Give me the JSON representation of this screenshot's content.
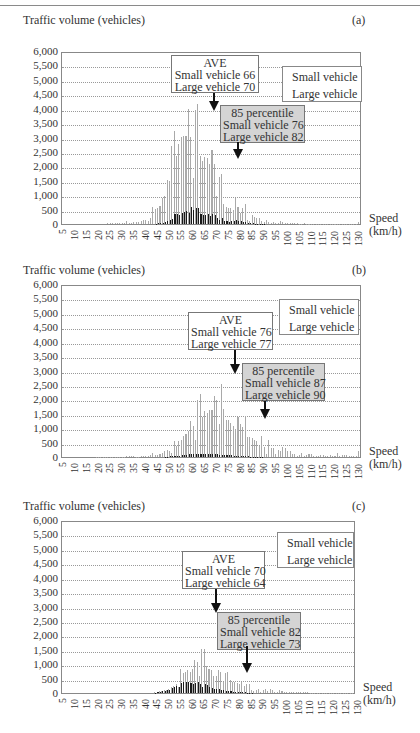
{
  "page": {
    "panels": [
      {
        "id": "a",
        "letter": "(a)",
        "y_title": "Traffic volume (vehicles)",
        "x_title_line1": "Speed",
        "x_title_line2": "(km/h)",
        "legend": {
          "small": "Small vehicle",
          "large": "Large vehicle"
        },
        "ave": {
          "title": "AVE",
          "small": "Small vehicle 66",
          "large": "Large vehicle 70"
        },
        "pct": {
          "title": "85 percentile",
          "small": "Small vehicle 76",
          "large": "Large vehicle 82"
        }
      },
      {
        "id": "b",
        "letter": "(b)",
        "y_title": "Traffic volume (vehicles)",
        "x_title_line1": "Speed",
        "x_title_line2": "(km/h)",
        "legend": {
          "small": "Small vehicle",
          "large": "Large vehicle"
        },
        "ave": {
          "title": "AVE",
          "small": "Small vehicle 76",
          "large": "Large vehicle 77"
        },
        "pct": {
          "title": "85 percentile",
          "small": "Small vehicle 87",
          "large": "Large vehicle 90"
        }
      },
      {
        "id": "c",
        "letter": "(c)",
        "y_title": "Traffic volume (vehicles)",
        "x_title_line1": "Speed",
        "x_title_line2": "(km/h)",
        "legend": {
          "small": "Small vehicle",
          "large": "Large vehicle"
        },
        "ave": {
          "title": "AVE",
          "small": "Small vehicle 70",
          "large": "Large vehicle 64"
        },
        "pct": {
          "title": "85 percentile",
          "small": "Small vehicle 82",
          "large": "Large vehicle 73"
        }
      }
    ],
    "colors": {
      "small": "#a9a9a9",
      "large": "#1a1a1a",
      "pct_box": "#d4d4d4",
      "grid": "#999999"
    }
  },
  "chart_data": [
    {
      "type": "bar",
      "title": "(a)",
      "xlabel": "Speed (km/h)",
      "ylabel": "Traffic volume (vehicles)",
      "ylim": [
        0,
        6000
      ],
      "yticks": [
        "0",
        "500",
        "1,000",
        "1,500",
        "2,000",
        "2,500",
        "3,000",
        "3,500",
        "4,000",
        "4,500",
        "5,000",
        "5,500",
        "6,000"
      ],
      "xticks": [
        "5",
        "10",
        "15",
        "20",
        "25",
        "30",
        "35",
        "40",
        "45",
        "50",
        "55",
        "60",
        "65",
        "70",
        "75",
        "80",
        "85",
        "90",
        "95",
        "100",
        "105",
        "110",
        "115",
        "120",
        "125",
        "130"
      ],
      "grid": true,
      "legend_position": "upper right",
      "x_start": 5,
      "x_step": 1,
      "annotations": [
        {
          "text": "AVE Small vehicle 66 Large vehicle 70",
          "x": 66
        },
        {
          "text": "85 percentile Small vehicle 76 Large vehicle 82",
          "x": 76
        }
      ],
      "series": [
        {
          "name": "Small vehicle",
          "values": [
            0,
            0,
            0,
            0,
            0,
            0,
            0,
            0,
            0,
            0,
            0,
            0,
            0,
            0,
            0,
            0,
            0,
            0,
            0,
            30,
            40,
            30,
            20,
            20,
            30,
            20,
            30,
            100,
            30,
            40,
            60,
            80,
            70,
            120,
            150,
            130,
            100,
            200,
            600,
            520,
            560,
            640,
            900,
            1000,
            1550,
            1500,
            2750,
            3250,
            2400,
            2800,
            3050,
            3100,
            3100,
            4050,
            3050,
            1600,
            4000,
            4200,
            2400,
            2200,
            2350,
            2300,
            2100,
            2600,
            2100,
            1000,
            1650,
            1750,
            700,
            600,
            550,
            550,
            500,
            900,
            600,
            400,
            550,
            700,
            150,
            100,
            300,
            250,
            200,
            200,
            120,
            60,
            150,
            60,
            40,
            80,
            30,
            40,
            100,
            80,
            30,
            20,
            20,
            30,
            20,
            20,
            10,
            10,
            20,
            10,
            10,
            10,
            10,
            10,
            10,
            10,
            10,
            10,
            10,
            10,
            10,
            10,
            10,
            10,
            10,
            10,
            10,
            10,
            10,
            10,
            10,
            80
          ]
        },
        {
          "name": "Large vehicle",
          "values": [
            0,
            0,
            0,
            0,
            0,
            0,
            0,
            0,
            0,
            0,
            0,
            0,
            0,
            0,
            0,
            0,
            0,
            0,
            0,
            0,
            0,
            0,
            0,
            0,
            0,
            0,
            0,
            0,
            0,
            0,
            0,
            0,
            0,
            0,
            0,
            0,
            0,
            0,
            0,
            10,
            20,
            30,
            50,
            60,
            100,
            150,
            180,
            350,
            350,
            330,
            380,
            420,
            450,
            380,
            580,
            480,
            550,
            550,
            350,
            300,
            320,
            350,
            280,
            350,
            300,
            200,
            150,
            200,
            100,
            90,
            80,
            100,
            90,
            150,
            120,
            100,
            80,
            60,
            30,
            20,
            20,
            10,
            10,
            10,
            10,
            10,
            0,
            0,
            0,
            0,
            0,
            0,
            0,
            0,
            0,
            0,
            0,
            0,
            0,
            0,
            0,
            0,
            0,
            0,
            0,
            0,
            0,
            0,
            0,
            0,
            0,
            0,
            0,
            0,
            0,
            0,
            0,
            0,
            0,
            0,
            0,
            0,
            0,
            0,
            0,
            0
          ]
        }
      ]
    },
    {
      "type": "bar",
      "title": "(b)",
      "xlabel": "Speed (km/h)",
      "ylabel": "Traffic volume (vehicles)",
      "ylim": [
        0,
        6000
      ],
      "yticks": [
        "0",
        "500",
        "1,000",
        "1,500",
        "2,000",
        "2,500",
        "3,000",
        "3,500",
        "4,000",
        "4,500",
        "5,000",
        "5,500",
        "6,000"
      ],
      "xticks": [
        "5",
        "10",
        "15",
        "20",
        "25",
        "30",
        "35",
        "40",
        "45",
        "50",
        "55",
        "60",
        "65",
        "70",
        "75",
        "80",
        "85",
        "90",
        "95",
        "100",
        "105",
        "110",
        "115",
        "120",
        "125",
        "130"
      ],
      "grid": true,
      "legend_position": "upper right",
      "x_start": 5,
      "x_step": 1,
      "annotations": [
        {
          "text": "AVE Small vehicle 76 Large vehicle 77",
          "x": 77
        },
        {
          "text": "85 percentile Small vehicle 87 Large vehicle 90",
          "x": 90
        }
      ],
      "series": [
        {
          "name": "Small vehicle",
          "values": [
            0,
            0,
            0,
            0,
            0,
            0,
            0,
            0,
            0,
            0,
            0,
            0,
            0,
            0,
            10,
            10,
            10,
            10,
            10,
            10,
            10,
            10,
            10,
            10,
            10,
            10,
            10,
            20,
            20,
            20,
            20,
            10,
            10,
            20,
            30,
            30,
            40,
            60,
            150,
            60,
            80,
            100,
            150,
            200,
            250,
            200,
            150,
            550,
            400,
            550,
            600,
            750,
            800,
            900,
            1250,
            1100,
            600,
            2000,
            2200,
            1400,
            1600,
            1550,
            1650,
            1650,
            2150,
            2000,
            1150,
            2550,
            1700,
            1300,
            1300,
            1200,
            1100,
            1000,
            1400,
            1150,
            1050,
            1450,
            700,
            700,
            650,
            600,
            550,
            400,
            750,
            350,
            100,
            600,
            300,
            300,
            100,
            250,
            200,
            350,
            300,
            200,
            200,
            100,
            100,
            50,
            80,
            150,
            50,
            60,
            120,
            100,
            50,
            50,
            50,
            60,
            60,
            50,
            50,
            80,
            50,
            50,
            150,
            50,
            60,
            80,
            60,
            50,
            50,
            50,
            50,
            200
          ]
        },
        {
          "name": "Large vehicle",
          "values": [
            0,
            0,
            0,
            0,
            0,
            0,
            0,
            0,
            0,
            0,
            0,
            0,
            0,
            0,
            0,
            0,
            0,
            0,
            0,
            0,
            0,
            0,
            0,
            0,
            0,
            0,
            0,
            0,
            0,
            0,
            0,
            0,
            0,
            0,
            0,
            0,
            0,
            0,
            0,
            0,
            0,
            0,
            0,
            10,
            10,
            20,
            20,
            30,
            40,
            50,
            60,
            80,
            80,
            100,
            100,
            100,
            100,
            120,
            100,
            120,
            120,
            100,
            100,
            120,
            100,
            120,
            80,
            80,
            80,
            80,
            60,
            60,
            50,
            40,
            40,
            30,
            20,
            20,
            20,
            10,
            10,
            10,
            10,
            10,
            10,
            0,
            0,
            0,
            0,
            0,
            0,
            0,
            0,
            0,
            0,
            0,
            0,
            0,
            0,
            0,
            0,
            0,
            0,
            0,
            0,
            0,
            0,
            0,
            0,
            0,
            0,
            0,
            0,
            0,
            0,
            0,
            0,
            0,
            0,
            0,
            0,
            0,
            0,
            0,
            0,
            0
          ]
        }
      ]
    },
    {
      "type": "bar",
      "title": "(c)",
      "xlabel": "Speed (km/h)",
      "ylabel": "Traffic volume (vehicles)",
      "ylim": [
        0,
        6000
      ],
      "yticks": [
        "0",
        "500",
        "1,000",
        "1,500",
        "2,000",
        "2,500",
        "3,000",
        "3,500",
        "4,000",
        "4,500",
        "5,000",
        "5,500",
        "6,000"
      ],
      "xticks": [
        "5",
        "10",
        "15",
        "20",
        "25",
        "30",
        "35",
        "40",
        "45",
        "50",
        "55",
        "60",
        "65",
        "70",
        "75",
        "80",
        "85",
        "90",
        "95",
        "100",
        "105",
        "110",
        "115",
        "120",
        "125",
        "130"
      ],
      "grid": true,
      "legend_position": "upper right",
      "x_start": 5,
      "x_step": 1,
      "annotations": [
        {
          "text": "AVE Small vehicle 70 Large vehicle 64",
          "x": 70
        },
        {
          "text": "85 percentile Small vehicle 82 Large vehicle 73",
          "x": 82
        }
      ],
      "series": [
        {
          "name": "Small vehicle",
          "values": [
            0,
            0,
            0,
            0,
            0,
            0,
            0,
            0,
            0,
            0,
            0,
            0,
            0,
            0,
            0,
            0,
            0,
            0,
            0,
            0,
            0,
            0,
            0,
            0,
            0,
            0,
            0,
            0,
            0,
            0,
            0,
            0,
            0,
            0,
            0,
            0,
            0,
            0,
            0,
            20,
            40,
            60,
            80,
            100,
            120,
            150,
            200,
            250,
            300,
            200,
            850,
            700,
            750,
            800,
            750,
            850,
            1150,
            1100,
            600,
            1550,
            1550,
            950,
            850,
            800,
            600,
            600,
            800,
            750,
            400,
            700,
            750,
            450,
            400,
            400,
            350,
            300,
            400,
            250,
            300,
            300,
            100,
            80,
            120,
            150,
            50,
            100,
            150,
            60,
            150,
            100,
            50,
            40,
            100,
            80,
            30,
            50,
            40,
            30,
            30,
            20,
            20,
            20,
            20,
            20,
            20,
            10,
            10,
            10,
            10,
            10,
            10,
            10,
            10,
            10,
            10,
            10,
            10,
            10,
            10,
            10,
            10,
            10,
            10,
            10
          ]
        },
        {
          "name": "Large vehicle",
          "values": [
            0,
            0,
            0,
            0,
            0,
            0,
            0,
            0,
            0,
            0,
            0,
            0,
            0,
            0,
            0,
            0,
            0,
            0,
            0,
            0,
            0,
            0,
            0,
            0,
            0,
            0,
            0,
            0,
            0,
            0,
            0,
            0,
            0,
            0,
            0,
            0,
            0,
            0,
            0,
            10,
            20,
            40,
            60,
            80,
            100,
            120,
            160,
            200,
            250,
            200,
            350,
            400,
            380,
            380,
            350,
            320,
            350,
            380,
            300,
            220,
            300,
            280,
            200,
            160,
            150,
            150,
            150,
            120,
            100,
            80,
            80,
            60,
            50,
            40,
            30,
            20,
            20,
            20,
            10,
            10,
            10,
            0,
            0,
            0,
            0,
            0,
            0,
            0,
            0,
            0,
            0,
            0,
            0,
            0,
            0,
            0,
            0,
            0,
            0,
            0,
            0,
            0,
            0,
            0,
            0,
            0,
            0,
            0,
            0,
            0,
            0,
            0,
            0,
            0,
            0,
            0,
            0,
            0,
            0,
            0,
            0,
            0,
            0,
            0,
            0,
            0
          ]
        }
      ]
    }
  ]
}
